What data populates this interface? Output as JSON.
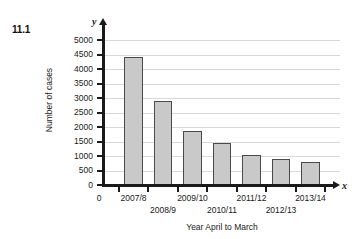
{
  "question_number": "11.1",
  "axis_letters": {
    "y": "y",
    "x": "x"
  },
  "chart_data": {
    "type": "bar",
    "title": "",
    "xlabel": "Year April to March",
    "ylabel": "Number of cases",
    "categories": [
      "2007/8",
      "2008/9",
      "2009/10",
      "2010/11",
      "2011/12",
      "2012/13",
      "2013/14"
    ],
    "values": [
      4400,
      2900,
      1850,
      1450,
      1050,
      900,
      800
    ],
    "ylim": [
      0,
      5000
    ],
    "ytick_step": 500,
    "ytick_labels": [
      "0",
      "500",
      "1000",
      "1500",
      "2000",
      "2500",
      "3000",
      "3500",
      "4000",
      "4500",
      "5000"
    ],
    "grid": true,
    "legend": "none",
    "bar_fill": "#c9c9c9",
    "bar_stroke": "#4a4a4a",
    "axis_color": "#1a1a1a",
    "grid_color": "#d8d8d8",
    "x_origin_label": "0"
  }
}
